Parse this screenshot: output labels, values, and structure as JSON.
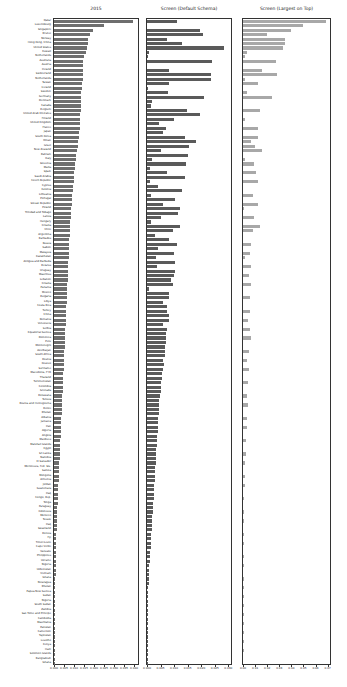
{
  "chart_data": [
    {
      "type": "bar",
      "orientation": "horizontal",
      "title": "2015",
      "xlabel": "",
      "ylabel": "",
      "xlim": [
        0,
        0.042
      ],
      "xticks": [
        "0.000",
        "0.005",
        "0.010",
        "0.015",
        "0.020",
        "0.025",
        "0.030",
        "0.035",
        "0.040"
      ],
      "bar_color": "#6e6e6e",
      "grid": false
    },
    {
      "type": "bar",
      "orientation": "horizontal",
      "title": "Screen (Default Schema)",
      "xlabel": "",
      "ylabel": "",
      "xlim": [
        0,
        0.031
      ],
      "xticks": [
        "0.000",
        "0.005",
        "0.010",
        "0.015",
        "0.020",
        "0.025",
        "0.030"
      ],
      "bar_color": "#5a5a5a",
      "grid": false
    },
    {
      "type": "bar",
      "orientation": "horizontal",
      "title": "Screen (Largest on Top)",
      "xlabel": "",
      "ylabel": "",
      "xlim": [
        0,
        0.072
      ],
      "xticks": [
        "0.00",
        "0.01",
        "0.02",
        "0.03",
        "0.04",
        "0.05",
        "0.06",
        "0.07"
      ],
      "bar_color": "#a8a8a8",
      "grid": false
    }
  ],
  "categories": [
    "Qatar",
    "Luxembourg",
    "Singapore",
    "Brunei",
    "Norway",
    "Hong Kong, China",
    "United States",
    "Kuwait",
    "Netherlands",
    "Australia",
    "Austria",
    "Ireland",
    "Switzerland",
    "Netherlands",
    "Taiwan",
    "Iceland",
    "Sweden",
    "Germany",
    "Denmark",
    "Canada",
    "Belgium",
    "United Arab Emirates",
    "Finland",
    "United Kingdom",
    "France",
    "Japan",
    "South Korea",
    "Oman",
    "Israel",
    "New Zealand",
    "Bahrain",
    "Italy",
    "Slovenia",
    "Malta",
    "Spain",
    "Saudi Arabia",
    "Czech Republic",
    "Cyprus",
    "Estonia",
    "Lithuania",
    "Portugal",
    "Slovak Republic",
    "Poland",
    "Trinidad and Tobago",
    "Latvia",
    "Hungary",
    "Croatia",
    "Chile",
    "Argentina",
    "Barbados",
    "Russia",
    "Gabon",
    "Malaysia",
    "Kazakhstan",
    "Antigua and Barbuda",
    "Belarus",
    "Uruguay",
    "Mauritius",
    "Lebanon",
    "Croatia",
    "Panama",
    "Mexico",
    "Bulgaria",
    "Libya",
    "Costa Rica",
    "Turkey",
    "China",
    "Romania",
    "Venezuela",
    "Serbia",
    "Equatorial Guinea",
    "Dominica",
    "Peru",
    "Montenegro",
    "Azerbaijan",
    "South Africa",
    "Bosnia",
    "Kosovo",
    "Suriname",
    "Macedonia, FYR",
    "Thailand",
    "Turkmenistan",
    "Colombia",
    "Grenada",
    "Botswana",
    "Tunisia",
    "Bosnia and Herzegovina",
    "Belize",
    "Bhutan",
    "Albania",
    "Jamaica",
    "Iran",
    "Algeria",
    "Angola",
    "Maldives",
    "Marshall Islands",
    "Egypt",
    "Sri Lanka",
    "Namibia",
    "El Salvador",
    "Micronesia, Fed. Sts.",
    "Samoa",
    "Mongolia",
    "Armenia",
    "Jordan",
    "Guatemala",
    "Iraq",
    "Congo, Rep.",
    "Tonga",
    "Paraguay",
    "Indonesia",
    "Morocco",
    "Tuvalu",
    "Iraq",
    "Swaziland",
    "Bolivia",
    "Fiji",
    "Timor-Leste",
    "Cape Verde",
    "Vanuatu",
    "Philippines",
    "Ukraine",
    "Nigeria",
    "Uzbekistan",
    "Vietnam",
    "Ghana",
    "Nicaragua",
    "Bhutan",
    "Papua New Guinea",
    "Sudan",
    "Nigeria",
    "South Sudan",
    "Zambia",
    "Sao Tome and Principe",
    "Cambodia",
    "Mauritania",
    "Pakistan",
    "Cameroon",
    "Tajikistan",
    "Lesotho",
    "Kenya",
    "Haiti",
    "Solomon Islands",
    "Bangladesh",
    "Ghana",
    "Myanmar",
    "Senegal",
    "Djibouti",
    "Cote d'Ivoire",
    "Kenya",
    "Guinea-Bissau",
    "Tanzania",
    "Chad",
    "Sierra Leone",
    "Rwanda",
    "Afghanistan",
    "Mali",
    "Uganda",
    "Nepal",
    "Mozambique",
    "Burkina Faso",
    "Ethiopia",
    "Comoros",
    "Togo",
    "Guinea",
    "Madagascar",
    "Malawi",
    "Gambia",
    "Niger",
    "Guinea-Bissau",
    "Zimbabwe",
    "Eritrea",
    "Liberia",
    "Burundi",
    "Congo, Dem. Rep."
  ],
  "series": [
    {
      "name": "2015",
      "values": [
        0.0395,
        0.0252,
        0.0195,
        0.0182,
        0.0172,
        0.017,
        0.0165,
        0.016,
        0.0148,
        0.0147,
        0.0146,
        0.0146,
        0.0145,
        0.0144,
        0.014,
        0.0139,
        0.0137,
        0.0136,
        0.0135,
        0.0134,
        0.0133,
        0.0132,
        0.0131,
        0.013,
        0.0128,
        0.0126,
        0.0124,
        0.012,
        0.0118,
        0.0116,
        0.0112,
        0.011,
        0.0106,
        0.0104,
        0.0102,
        0.01,
        0.0098,
        0.0097,
        0.0094,
        0.0092,
        0.009,
        0.0089,
        0.0087,
        0.0085,
        0.0083,
        0.0081,
        0.008,
        0.0079,
        0.0078,
        0.0077,
        0.0076,
        0.0075,
        0.0074,
        0.0073,
        0.0072,
        0.0071,
        0.007,
        0.0069,
        0.0068,
        0.0067,
        0.0066,
        0.0065,
        0.0064,
        0.0063,
        0.0062,
        0.0061,
        0.006,
        0.0059,
        0.0058,
        0.0057,
        0.0056,
        0.0055,
        0.0054,
        0.0053,
        0.0052,
        0.0051,
        0.005,
        0.0049,
        0.0048,
        0.0047,
        0.0046,
        0.0045,
        0.0044,
        0.0043,
        0.0042,
        0.0041,
        0.004,
        0.0039,
        0.0038,
        0.0037,
        0.0036,
        0.0035,
        0.0034,
        0.0033,
        0.0032,
        0.0031,
        0.003,
        0.0029,
        0.0028,
        0.0027,
        0.0026,
        0.0025,
        0.0024,
        0.0023,
        0.0022,
        0.0021,
        0.002,
        0.0019,
        0.0018,
        0.0017,
        0.0016,
        0.0015,
        0.0014,
        0.0013,
        0.0013,
        0.0012,
        0.0012,
        0.0011,
        0.0011,
        0.001,
        0.001,
        0.0009,
        0.0009,
        0.0008,
        0.0008,
        0.0007,
        0.0007,
        0.0006,
        0.0006,
        0.0006,
        0.0005,
        0.0005,
        0.0005,
        0.0004,
        0.0004,
        0.0004,
        0.0004,
        0.0003,
        0.0003,
        0.0003,
        0.0003,
        0.0003,
        0.0002,
        0.0002,
        0.0002,
        0.0002,
        0.0002,
        0.0002,
        0.0002,
        0.0002,
        0.0002,
        0.0001,
        0.0001,
        0.0001,
        0.0001,
        0.0001,
        0.0001,
        0.0001,
        0.0001,
        0.0001,
        0.0001,
        0.0001,
        0.0001,
        0.0001,
        0.0001,
        0.0001,
        0.0001,
        0.0001,
        0.0001
      ]
    },
    {
      "name": "Screen (Default Schema)",
      "values": [
        0.011,
        0.0,
        0.0195,
        0.0205,
        0.0075,
        0.013,
        0.0283,
        0.0008,
        0.0004,
        0.024,
        0.0,
        0.008,
        0.0238,
        0.0236,
        0.008,
        0.0005,
        0.0078,
        0.021,
        0.002,
        0.0015,
        0.0148,
        0.0195,
        0.01,
        0.0045,
        0.007,
        0.006,
        0.014,
        0.018,
        0.0155,
        0.005,
        0.015,
        0.002,
        0.0145,
        0.001,
        0.0075,
        0.014,
        0.001,
        0.004,
        0.013,
        0.0015,
        0.0105,
        0.006,
        0.012,
        0.0115,
        0.005,
        0.0015,
        0.012,
        0.0095,
        0.003,
        0.008,
        0.011,
        0.004,
        0.01,
        0.0035,
        0.0105,
        0.0038,
        0.0102,
        0.01,
        0.009,
        0.0095,
        0.0008,
        0.0082,
        0.008,
        0.006,
        0.0075,
        0.0075,
        0.008,
        0.0082,
        0.006,
        0.0075,
        0.007,
        0.007,
        0.007,
        0.0068,
        0.0068,
        0.0066,
        0.006,
        0.0062,
        0.006,
        0.0055,
        0.0054,
        0.0053,
        0.0052,
        0.005,
        0.0048,
        0.0046,
        0.0045,
        0.0044,
        0.0043,
        0.0042,
        0.0041,
        0.004,
        0.0039,
        0.0038,
        0.0037,
        0.0036,
        0.0035,
        0.0034,
        0.0033,
        0.0032,
        0.0031,
        0.003,
        0.0029,
        0.0028,
        0.0027,
        0.0026,
        0.0025,
        0.0024,
        0.0023,
        0.0022,
        0.0021,
        0.002,
        0.0019,
        0.0018,
        0.0017,
        0.0016,
        0.0015,
        0.0014,
        0.0013,
        0.0012,
        0.0011,
        0.001,
        0.0009,
        0.0008,
        0.0007,
        0.0006,
        0.0006,
        0.0005,
        0.0005,
        0.0004,
        0.0004,
        0.0004,
        0.0003,
        0.0003,
        0.0003,
        0.0003,
        0.0002,
        0.0002,
        0.0002,
        0.0002,
        0.0002,
        0.0002,
        0.0002,
        0.0001,
        0.0001,
        0.0001,
        0.0001,
        0.0001,
        0.0001,
        0.0001,
        0.0001,
        0.0001,
        0.0001,
        0.0001,
        0.0001,
        0.0001,
        0.0001,
        0.0001,
        0.0001,
        0.0001,
        0.0001,
        0.0001,
        0.0001,
        0.0001,
        0.0001,
        0.0001,
        0.0001
      ]
    },
    {
      "name": "Screen (Largest on Top)",
      "values": [
        0.069,
        0.0495,
        0.0395,
        0.02,
        0.035,
        0.035,
        0.033,
        0.003,
        0.002,
        0.027,
        0.0,
        0.0155,
        0.028,
        0.0015,
        0.0125,
        0.0,
        0.003,
        0.024,
        0.0,
        0.0,
        0.014,
        0.0,
        0.0015,
        0.0,
        0.012,
        0.0,
        0.012,
        0.007,
        0.01,
        0.016,
        0.0,
        0.002,
        0.009,
        0.0,
        0.0105,
        0.0,
        0.012,
        0.0,
        0.0,
        0.0085,
        0.0,
        0.012,
        0.0005,
        0.0,
        0.0095,
        0.0,
        0.014,
        0.008,
        0.0,
        0.0,
        0.007,
        0.0,
        0.006,
        0.0015,
        0.0,
        0.007,
        0.0,
        0.005,
        0.0,
        0.0065,
        0.0,
        0.0,
        0.0055,
        0.0,
        0.0,
        0.006,
        0.0,
        0.0045,
        0.0,
        0.0055,
        0.0,
        0.0065,
        0.0,
        0.0,
        0.005,
        0.0,
        0.003,
        0.0,
        0.005,
        0.0,
        0.0,
        0.0045,
        0.0,
        0.0,
        0.0035,
        0.0,
        0.004,
        0.0,
        0.0,
        0.0035,
        0.0,
        0.003,
        0.0,
        0.0,
        0.0025,
        0.0,
        0.0,
        0.0022,
        0.0,
        0.002,
        0.0,
        0.0,
        0.0018,
        0.0,
        0.0015,
        0.0,
        0.0,
        0.0012,
        0.0,
        0.0,
        0.001,
        0.0,
        0.0008,
        0.0,
        0.0,
        0.0006,
        0.0,
        0.0005,
        0.0,
        0.0,
        0.0004,
        0.0,
        0.0003,
        0.0,
        0.0,
        0.0002,
        0.0,
        0.0002,
        0.0,
        0.0001,
        0.0,
        0.0001,
        0.0,
        0.0001,
        0.0,
        0.0001,
        0.0,
        0.0001,
        0.0,
        0.0001,
        0.0,
        0.0001,
        0.0,
        0.0,
        0.0,
        0.0,
        0.0,
        0.0,
        0.0,
        0.0,
        0.0,
        0.0,
        0.0,
        0.0,
        0.0,
        0.0,
        0.0,
        0.0,
        0.0,
        0.0,
        0.0,
        0.0,
        0.0
      ]
    }
  ],
  "layout": {
    "panels": [
      {
        "left": 53,
        "width": 86
      },
      {
        "left": 146,
        "width": 86
      },
      {
        "left": 242,
        "width": 89
      }
    ],
    "top": 18,
    "height": 647
  }
}
